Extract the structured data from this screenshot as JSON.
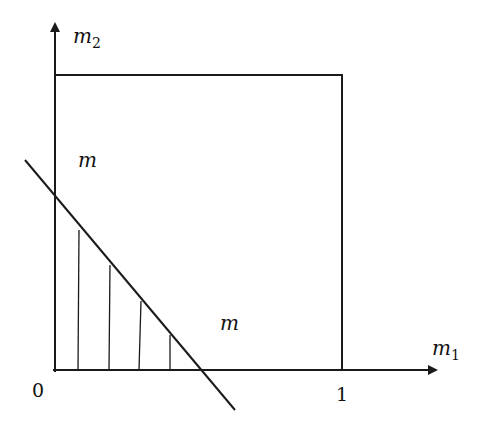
{
  "diagram": {
    "axes": {
      "y_label": "m",
      "y_label_sub": "2",
      "x_label": "m",
      "x_label_sub": "1",
      "origin_label": "0",
      "x_tick_label": "1"
    },
    "regions": {
      "upper_label": "m",
      "lower_right_label": "m"
    },
    "elements": [
      "unit square [0,1]x[0,1]",
      "diagonal line crossing y-axis and x-axis",
      "vertical hatching in triangle below the line"
    ]
  }
}
